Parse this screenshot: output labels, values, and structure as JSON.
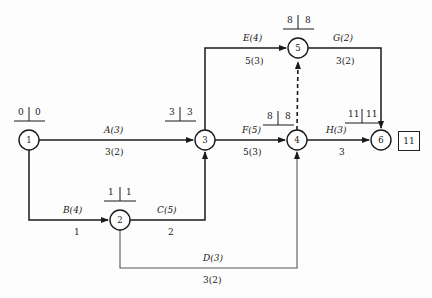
{
  "diagram": {
    "type": "activity-on-arrow-network",
    "title_text": "",
    "finish_time_box": "11",
    "nodes": [
      {
        "id": "1",
        "label": "1",
        "cx": 29,
        "cy": 140,
        "r": 10,
        "early": "0",
        "late": "0",
        "time_label_x": 12,
        "time_label_y": 108
      },
      {
        "id": "2",
        "label": "2",
        "cx": 120,
        "cy": 220,
        "r": 10,
        "early": "1",
        "late": "1",
        "time_label_x": 103,
        "time_label_y": 188
      },
      {
        "id": "3",
        "label": "3",
        "cx": 205,
        "cy": 140,
        "r": 10,
        "early": "3",
        "late": "3",
        "time_label_x": 166,
        "time_label_y": 108
      },
      {
        "id": "4",
        "label": "4",
        "cx": 297,
        "cy": 140,
        "r": 10,
        "early": "8",
        "late": "8",
        "time_label_x": 264,
        "time_label_y": 112
      },
      {
        "id": "5",
        "label": "5",
        "cx": 298,
        "cy": 48,
        "r": 10,
        "early": "8",
        "late": "8",
        "time_label_x": 281,
        "time_label_y": 16
      },
      {
        "id": "6",
        "label": "6",
        "cx": 381,
        "cy": 140,
        "r": 10,
        "early": "11",
        "late": "11",
        "time_label_x": 345,
        "time_label_y": 110
      }
    ],
    "activities": [
      {
        "key": "A",
        "name": "A(3)",
        "cost": "3(2)",
        "from": "1",
        "to": "3",
        "duration": 3,
        "crash": 2,
        "name_x": 104,
        "name_y": 126,
        "cost_x": 104,
        "cost_y": 148
      },
      {
        "key": "B",
        "name": "B(4)",
        "cost": "1",
        "from": "1",
        "to": "2",
        "duration": 4,
        "crash": 1,
        "name_x": 63,
        "name_y": 206,
        "cost_x": 72,
        "cost_y": 228
      },
      {
        "key": "C",
        "name": "C(5)",
        "cost": "2",
        "from": "2",
        "to": "3",
        "duration": 5,
        "crash": 2,
        "name_x": 157,
        "name_y": 206,
        "cost_x": 166,
        "cost_y": 228
      },
      {
        "key": "D",
        "name": "D(3)",
        "cost": "3(2)",
        "from": "2",
        "to": "4",
        "duration": 3,
        "crash": 2,
        "name_x": 203,
        "name_y": 255,
        "cost_x": 203,
        "cost_y": 276
      },
      {
        "key": "E",
        "name": "E(4)",
        "cost": "5(3)",
        "from": "3",
        "to": "5",
        "duration": 4,
        "crash": 3,
        "name_x": 243,
        "name_y": 35,
        "cost_x": 246,
        "cost_y": 57
      },
      {
        "key": "F",
        "name": "F(5)",
        "cost": "5(3)",
        "from": "3",
        "to": "4",
        "duration": 5,
        "crash": 3,
        "name_x": 243,
        "name_y": 126,
        "cost_x": 243,
        "cost_y": 148
      },
      {
        "key": "G",
        "name": "G(2)",
        "cost": "3(2)",
        "from": "5",
        "to": "6",
        "duration": 2,
        "crash": 2,
        "name_x": 333,
        "name_y": 35,
        "cost_x": 336,
        "cost_y": 57
      },
      {
        "key": "H",
        "name": "H(3)",
        "cost": "3",
        "from": "4",
        "to": "6",
        "duration": 3,
        "crash": 3,
        "name_x": 326,
        "name_y": 126,
        "cost_x": 337,
        "cost_y": 148
      },
      {
        "key": "dummy",
        "name": "",
        "cost": "",
        "from": "4",
        "to": "5",
        "duration": 0,
        "crash": 0,
        "name_x": 0,
        "name_y": 0,
        "cost_x": 0,
        "cost_y": 0
      }
    ],
    "colors": {
      "line": "#1a1a1a",
      "node_fill": "#ffffff",
      "text": "#1a1a1a",
      "background": "#fdfdfd"
    }
  }
}
